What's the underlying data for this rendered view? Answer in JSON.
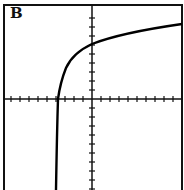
{
  "panel": {
    "label": "B",
    "colors": {
      "axis": "#111111",
      "curve": "#000000",
      "frame": "#111111",
      "background": "#ffffff"
    }
  },
  "chart_data": {
    "type": "line",
    "title": "B",
    "xlabel": "",
    "ylabel": "",
    "grid": false,
    "x_ticks_left": 9,
    "x_ticks_right": 10,
    "y_ticks_up": 9,
    "y_ticks_down": 10,
    "xlim": [
      -10,
      10
    ],
    "ylim": [
      -10,
      10
    ],
    "curve_description": "logarithmic curve with vertical asymptote near x = -4, crossing x-axis near x = -3.8 and y-axis near y = 6",
    "series": [
      {
        "name": "curve",
        "x": [
          -4.0,
          -3.9,
          -3.8,
          -3.3,
          -2.7,
          -1.8,
          0,
          2,
          5.3,
          10
        ],
        "y": [
          -10,
          -2.3,
          0,
          2.3,
          4.0,
          5.2,
          6.1,
          6.9,
          7.7,
          8.3
        ]
      }
    ]
  }
}
